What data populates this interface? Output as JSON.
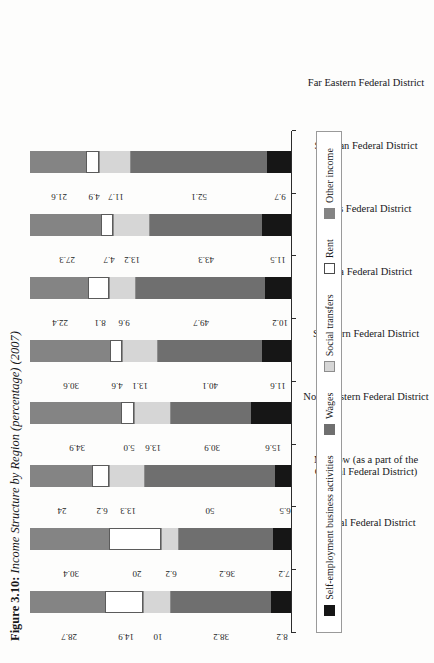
{
  "figure": {
    "number": "Figure 3.10:",
    "caption": "Income Structure by Region (percentage) (2007)"
  },
  "legend": {
    "items": [
      {
        "label": "Self-employment business activities",
        "color": "#161616"
      },
      {
        "label": "Wages",
        "color": "#6f6f6f"
      },
      {
        "label": "Social transfers",
        "color": "#d6d6d6"
      },
      {
        "label": "Rent",
        "color": "#ffffff"
      },
      {
        "label": "Other income",
        "color": "#848484"
      }
    ]
  },
  "chart_data": {
    "type": "bar",
    "title": "Figure 3.10: Income Structure by Region (percentage) (2007)",
    "xlabel": "",
    "ylabel": "",
    "ylim": [
      0,
      100
    ],
    "grid": false,
    "stacked": true,
    "orientation": "vertical",
    "legend_position": "bottom",
    "categories": [
      "Central Federal District",
      "Moscow (as a part of the Central Federal District)",
      "Northwestern Federal District",
      "Southern Federal District",
      "Volga Federal District",
      "Urals Federal District",
      "Siberian Federal District",
      "Far Eastern Federal District"
    ],
    "category_lines": [
      [
        "Central Federal District"
      ],
      [
        "Moscow (as a part of the",
        "Central Federal District)"
      ],
      [
        "Northwestern Federal District"
      ],
      [
        "Southern Federal District"
      ],
      [
        "Volga Federal District"
      ],
      [
        "Urals Federal District"
      ],
      [
        "Siberian Federal District"
      ],
      [
        "Far Eastern Federal District"
      ]
    ],
    "series": [
      {
        "name": "Self-employment business activities",
        "color": "#161616",
        "values": [
          8.2,
          7.2,
          6.5,
          15.6,
          11.6,
          10.2,
          11.5,
          9.7
        ]
      },
      {
        "name": "Wages",
        "color": "#6f6f6f",
        "values": [
          38.2,
          36.2,
          50,
          30.9,
          40.1,
          49.7,
          43.3,
          52.1
        ]
      },
      {
        "name": "Social transfers",
        "color": "#d6d6d6",
        "values": [
          10,
          6.2,
          13.3,
          13.6,
          13.1,
          9.6,
          13.2,
          11.7
        ]
      },
      {
        "name": "Rent",
        "color": "#ffffff",
        "values": [
          14.9,
          20,
          6.2,
          5.0,
          4.6,
          8.1,
          4.7,
          4.9
        ]
      },
      {
        "name": "Other income",
        "color": "#848484",
        "values": [
          28.7,
          30.4,
          24,
          34.9,
          30.6,
          22.4,
          27.3,
          21.6
        ]
      }
    ],
    "value_labels": [
      [
        "8.2",
        "38.2",
        "10",
        "14.9",
        "28.7"
      ],
      [
        "7.2",
        "36.2",
        "6.2",
        "20",
        "30.4"
      ],
      [
        "6.5",
        "50",
        "13.3",
        "6.2",
        "24"
      ],
      [
        "15.6",
        "30.9",
        "13.6",
        "5.0",
        "34.9"
      ],
      [
        "11.6",
        "40.1",
        "13.1",
        "4.6",
        "30.6"
      ],
      [
        "10.2",
        "49.7",
        "9.6",
        "8.1",
        "22.4"
      ],
      [
        "11.5",
        "43.3",
        "13.2",
        "4.7",
        "27.3"
      ],
      [
        "9.7",
        "52.1",
        "11.7",
        "4.9",
        "21.6"
      ]
    ]
  }
}
